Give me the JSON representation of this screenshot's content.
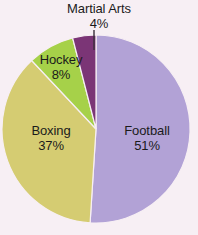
{
  "chart_data": {
    "type": "pie",
    "title": "",
    "categories": [
      "Football",
      "Boxing",
      "Hockey",
      "Martial Arts"
    ],
    "values": [
      51,
      37,
      8,
      4
    ],
    "value_unit": "%",
    "colors": [
      "#b2a2d6",
      "#d5cc72",
      "#a6d149",
      "#7b3576"
    ],
    "legend": "none",
    "label_position": "inside-with-callout",
    "start_angle_deg": 0,
    "direction": "clockwise",
    "slices": [
      {
        "name": "Football",
        "percent": 51,
        "label": "Football",
        "percent_label": "51%",
        "color": "#b2a2d6",
        "start_deg": 0,
        "end_deg": 183.6,
        "callout": false
      },
      {
        "name": "Boxing",
        "percent": 37,
        "label": "Boxing",
        "percent_label": "37%",
        "color": "#d5cc72",
        "start_deg": 183.6,
        "end_deg": 316.8,
        "callout": false
      },
      {
        "name": "Hockey",
        "percent": 8,
        "label": "Hockey",
        "percent_label": "8%",
        "color": "#a6d149",
        "start_deg": 316.8,
        "end_deg": 345.6,
        "callout": false
      },
      {
        "name": "Martial Arts",
        "percent": 4,
        "label": "Martial Arts",
        "percent_label": "4%",
        "color": "#7b3576",
        "start_deg": 345.6,
        "end_deg": 360,
        "callout": true
      }
    ],
    "background_color": "#f7eff4",
    "text_color": "#1b1b1b",
    "leader_line_color": "#3a2f3a"
  }
}
